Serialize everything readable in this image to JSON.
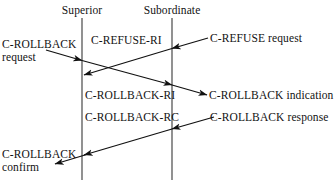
{
  "diagram": {
    "type": "sequence-diagram",
    "background_color": "#ffffff",
    "line_color": "#6e6e6e",
    "arrow_color": "#111111",
    "text_color": "#121212",
    "lifelines": [
      {
        "id": "superior",
        "label": "Superior",
        "x": 82
      },
      {
        "id": "subordinate",
        "label": "Subordinate",
        "x": 172
      }
    ],
    "messages": [
      {
        "id": "c-rollback-request",
        "label": "C-ROLLBACK",
        "label_line2": "request",
        "direction": "left-to-superior",
        "from": "user-left",
        "to": "superior"
      },
      {
        "id": "c-refuse-request",
        "label": "C-REFUSE request",
        "direction": "right-to-subordinate",
        "from": "user-right",
        "to": "subordinate"
      },
      {
        "id": "c-refuse-ri",
        "label": "C-REFUSE-RI",
        "direction": "subordinate-to-superior",
        "from": "subordinate",
        "to": "superior"
      },
      {
        "id": "c-rollback-ri",
        "label": "C-ROLLBACK-RI",
        "direction": "superior-to-subordinate",
        "from": "superior",
        "to": "user-right"
      },
      {
        "id": "c-rollback-indication",
        "label": "C-ROLLBACK indication",
        "direction": "to-right-user",
        "from": "subordinate",
        "to": "user-right"
      },
      {
        "id": "c-rollback-response",
        "label": "C-ROLLBACK response",
        "direction": "right-to-subordinate",
        "from": "user-right",
        "to": "subordinate"
      },
      {
        "id": "c-rollback-rc",
        "label": "C-ROLLBACK-RC",
        "direction": "subordinate-to-superior",
        "from": "subordinate",
        "to": "superior"
      },
      {
        "id": "c-rollback-confirm",
        "label": "C-ROLLBACK",
        "label_line2": "confirm",
        "direction": "superior-to-left-user",
        "from": "superior",
        "to": "user-left"
      }
    ]
  }
}
